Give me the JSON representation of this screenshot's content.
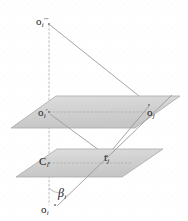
{
  "figure": {
    "background_color": "#fdfdfd",
    "plane_fill": "#d2d2d2",
    "plane_stroke": "#9a9a9a",
    "line_color": "#8f8f8f",
    "label_color": "#1a1a1a"
  },
  "labels": {
    "o_top": {
      "base": "o",
      "sub": "i",
      "sup": "′′′",
      "x": 36,
      "y": 12
    },
    "o_upper_left": {
      "base": "o",
      "sub": "i",
      "sup": "′",
      "x": 38,
      "y": 103
    },
    "o_upper_right": {
      "base": "o",
      "sub": "j",
      "sup": "",
      "x": 147,
      "y": 103
    },
    "c_lower_left": {
      "base": "C",
      "sub": "i",
      "sup": "",
      "x": 39,
      "y": 152
    },
    "t_lower_right": {
      "base": "t",
      "sub": "j",
      "sup": "",
      "x": 104,
      "y": 148
    },
    "beta": {
      "base": "β",
      "sub": "i",
      "sup": "",
      "x": 58,
      "y": 184
    },
    "o_bottom": {
      "base": "o",
      "sub": "i",
      "sup": "",
      "x": 41,
      "y": 200
    }
  },
  "geometry": {
    "upper_plane": {
      "name": "upper-plane",
      "points": "11,128 56,96 180,96 135,128",
      "vertices": [
        [
          11,
          128
        ],
        [
          56,
          96
        ],
        [
          180,
          96
        ],
        [
          135,
          128
        ]
      ]
    },
    "lower_plane": {
      "name": "lower-plane",
      "points": "16,177 57,149 163,149 122,177",
      "vertices": [
        [
          16,
          177
        ],
        [
          57,
          149
        ],
        [
          163,
          149
        ],
        [
          122,
          177
        ]
      ]
    },
    "vertical_axis": {
      "x1": 49,
      "y1": 24,
      "x2": 49,
      "y2": 205
    },
    "ray_top_to_oj": {
      "x1": 50,
      "y1": 25,
      "x2": 149,
      "y2": 104
    },
    "ray_oj_to_tj": {
      "x1": 149,
      "y1": 106,
      "x2": 107,
      "y2": 156
    },
    "ray_oiprime_to_tj": {
      "x1": 50,
      "y1": 114,
      "x2": 107,
      "y2": 156
    },
    "ray_oi_to_oj": {
      "x1": 57,
      "y1": 206,
      "x2": 170,
      "y2": 96
    },
    "upper_plane_midline": {
      "x1": 49,
      "y1": 112,
      "x2": 148,
      "y2": 112
    },
    "lower_plane_midline": {
      "x1": 49,
      "y1": 163,
      "x2": 132,
      "y2": 163
    },
    "beta_arc": {
      "cx": 49,
      "cy": 205,
      "r": 17,
      "start_deg": -90,
      "end_deg": -45
    }
  }
}
